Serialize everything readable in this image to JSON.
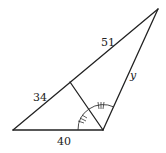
{
  "diagram": {
    "type": "triangle-angle-bisector",
    "vertices": {
      "left": [
        13,
        130
      ],
      "bottom_right": [
        103,
        130
      ],
      "top": [
        158,
        9
      ],
      "bisector_foot": [
        70,
        82
      ]
    },
    "labels": {
      "upper_hypotenuse": "51",
      "lower_hypotenuse": "34",
      "base": "40",
      "right_side": "y"
    },
    "angle_marks": {
      "count_per_angle": 3,
      "description": "equal angles marked with triple ticks on both sides of bisector"
    },
    "colors": {
      "stroke": "#222222",
      "background": "#ffffff"
    }
  }
}
